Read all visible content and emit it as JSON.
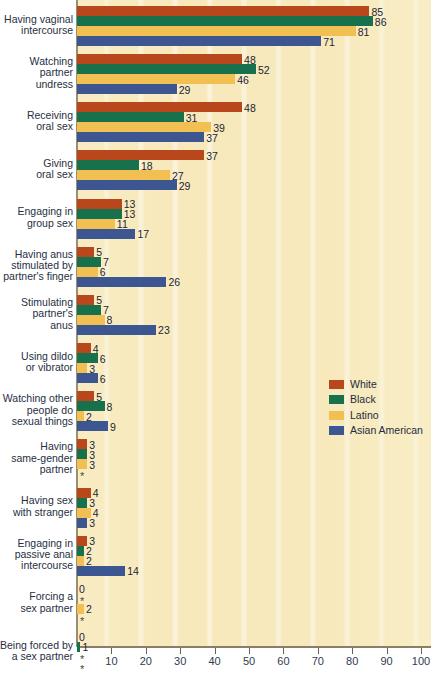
{
  "chart_data": {
    "type": "bar",
    "orientation": "horizontal",
    "title": "",
    "xlabel": "",
    "ylabel": "",
    "xlim": [
      0,
      100
    ],
    "xticks": [
      10,
      20,
      30,
      40,
      50,
      60,
      70,
      80,
      90,
      100
    ],
    "xtick_labels": [
      "10",
      "20",
      "30",
      "40",
      "50",
      "60",
      "70",
      "80",
      "90",
      "100"
    ],
    "grid": "vertical-bands",
    "legend_position": "middle-right",
    "suppressed_marker": "*",
    "categories": [
      "Having vaginal intercourse",
      "Watching partner undress",
      "Receiving oral sex",
      "Giving oral sex",
      "Engaging in group sex",
      "Having anus stimulated by partner's finger",
      "Stimulating partner's anus",
      "Using dildo or vibrator",
      "Watching other people do sexual things",
      "Having same-gender partner",
      "Having sex with stranger",
      "Engaging in passive anal intercourse",
      "Forcing a sex partner",
      "Being forced by a sex partner"
    ],
    "category_lines": [
      [
        "Having vaginal",
        "intercourse"
      ],
      [
        "Watching",
        "partner",
        "undress"
      ],
      [
        "Receiving",
        "oral sex"
      ],
      [
        "Giving",
        "oral sex"
      ],
      [
        "Engaging in",
        "group sex"
      ],
      [
        "Having anus",
        "stimulated by",
        "partner's finger"
      ],
      [
        "Stimulating",
        "partner's",
        "anus"
      ],
      [
        "Using dildo",
        "or vibrator"
      ],
      [
        "Watching other",
        "people do",
        "sexual things"
      ],
      [
        "Having",
        "same-gender",
        "partner"
      ],
      [
        "Having sex",
        "with stranger"
      ],
      [
        "Engaging in",
        "passive anal",
        "intercourse"
      ],
      [
        "Forcing a",
        "sex partner"
      ],
      [
        "Being forced by",
        "a sex partner"
      ]
    ],
    "series": [
      {
        "name": "White",
        "color": "#b8471b",
        "values": [
          85,
          48,
          48,
          37,
          13,
          5,
          5,
          4,
          5,
          3,
          4,
          3,
          0,
          0
        ],
        "labels": [
          "85",
          "48",
          "48",
          "37",
          "13",
          "5",
          "5",
          "4",
          "5",
          "3",
          "4",
          "3",
          "0",
          "0"
        ]
      },
      {
        "name": "Black",
        "color": "#17714c",
        "values": [
          86,
          52,
          31,
          18,
          13,
          7,
          7,
          6,
          8,
          3,
          3,
          2,
          null,
          1
        ],
        "labels": [
          "86",
          "52",
          "31",
          "18",
          "13",
          "7",
          "7",
          "6",
          "8",
          "3",
          "3",
          "2",
          "*",
          "1"
        ]
      },
      {
        "name": "Latino",
        "color": "#f2bf52",
        "values": [
          81,
          46,
          39,
          27,
          11,
          6,
          8,
          3,
          2,
          3,
          4,
          2,
          2,
          null
        ],
        "labels": [
          "81",
          "46",
          "39",
          "27",
          "11",
          "6",
          "8",
          "3",
          "2",
          "3",
          "4",
          "2",
          "2",
          "*"
        ]
      },
      {
        "name": "Asian American",
        "color": "#3c5692",
        "values": [
          71,
          29,
          37,
          29,
          17,
          26,
          23,
          6,
          9,
          null,
          3,
          14,
          null,
          null
        ],
        "labels": [
          "71",
          "29",
          "37",
          "29",
          "17",
          "26",
          "23",
          "6",
          "9",
          "*",
          "3",
          "14",
          "*",
          "*"
        ]
      }
    ]
  },
  "legend": {
    "entries": [
      {
        "label": "White",
        "color": "#b8471b"
      },
      {
        "label": "Black",
        "color": "#17714c"
      },
      {
        "label": "Latino",
        "color": "#f2bf52"
      },
      {
        "label": "Asian American",
        "color": "#3c5692"
      }
    ]
  },
  "colors": {
    "plot_background": "#f7e9bb",
    "page_background": "#ffffff",
    "axis": "#8a7f63",
    "text": "#262f42"
  }
}
